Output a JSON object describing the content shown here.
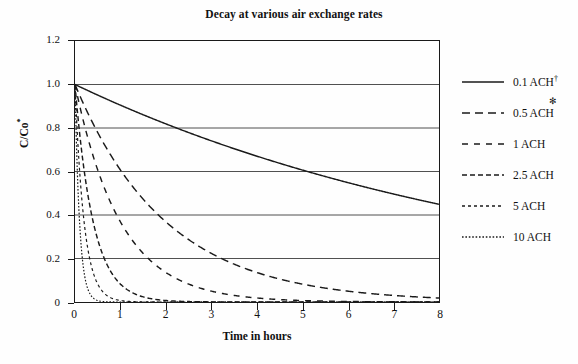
{
  "chart_data": {
    "type": "line",
    "title": "Decay at various air exchange rates",
    "xlabel": "Time in hours",
    "ylabel": "C/Co*",
    "ylabel_base": "C/Co",
    "ylabel_sup": "*",
    "xlim": [
      0,
      8
    ],
    "ylim": [
      0,
      1.2
    ],
    "x_ticks": [
      "0",
      "1",
      "2",
      "3",
      "4",
      "5",
      "6",
      "7",
      "8"
    ],
    "x_tick_values": [
      0,
      1,
      2,
      3,
      4,
      5,
      6,
      7,
      8
    ],
    "y_ticks": [
      "0",
      "0.2",
      "0.4",
      "0.6",
      "0.8",
      "1.0",
      "1.2"
    ],
    "y_tick_values": [
      0,
      0.2,
      0.4,
      0.6,
      0.8,
      1.0,
      1.2
    ],
    "grid": "horizontal",
    "grid_values": [
      0.2,
      0.4,
      0.6,
      0.8,
      1.0
    ],
    "legend_position": "right",
    "formula": "C/Co = exp(-k * t)",
    "x": [
      0,
      0.25,
      0.5,
      0.75,
      1,
      1.25,
      1.5,
      1.75,
      2,
      2.5,
      3,
      3.5,
      4,
      4.5,
      5,
      5.5,
      6,
      6.5,
      7,
      7.5,
      8
    ],
    "series": [
      {
        "name": "0.1 ACH",
        "rate": 0.1,
        "dash": "none",
        "values": [
          1.0,
          0.975,
          0.951,
          0.928,
          0.905,
          0.882,
          0.861,
          0.839,
          0.819,
          0.779,
          0.741,
          0.705,
          0.67,
          0.638,
          0.607,
          0.577,
          0.549,
          0.522,
          0.497,
          0.472,
          0.449
        ]
      },
      {
        "name": "0.5 ACH",
        "rate": 0.5,
        "dash": "8,5",
        "values": [
          1.0,
          0.882,
          0.779,
          0.687,
          0.607,
          0.535,
          0.472,
          0.417,
          0.368,
          0.287,
          0.223,
          0.174,
          0.135,
          0.105,
          0.082,
          0.064,
          0.05,
          0.039,
          0.03,
          0.024,
          0.018
        ]
      },
      {
        "name": "1 ACH",
        "rate": 1.0,
        "dash": "6,6",
        "values": [
          1.0,
          0.779,
          0.607,
          0.472,
          0.368,
          0.287,
          0.223,
          0.174,
          0.135,
          0.082,
          0.05,
          0.03,
          0.018,
          0.011,
          0.0067,
          0.0041,
          0.0025,
          0.0015,
          0.0009,
          0.0006,
          0.0003
        ]
      },
      {
        "name": "2.5 ACH",
        "rate": 2.5,
        "dash": "5,3",
        "values": [
          1.0,
          0.535,
          0.287,
          0.153,
          0.082,
          0.044,
          0.024,
          0.013,
          0.0067,
          0.0019,
          0.0006,
          0.0002,
          5e-05,
          1e-05,
          0.0,
          0.0,
          0.0,
          0.0,
          0.0,
          0.0,
          0.0
        ]
      },
      {
        "name": "5 ACH",
        "rate": 5.0,
        "dash": "3,3",
        "values": [
          1.0,
          0.287,
          0.082,
          0.024,
          0.0067,
          0.0019,
          0.0006,
          0.0002,
          5e-05,
          0.0,
          0.0,
          0.0,
          0.0,
          0.0,
          0.0,
          0.0,
          0.0,
          0.0,
          0.0,
          0.0,
          0.0
        ]
      },
      {
        "name": "10 ACH",
        "rate": 10.0,
        "dash": "1.6,1.8",
        "values": [
          1.0,
          0.082,
          0.0067,
          0.0006,
          5e-05,
          0.0,
          0.0,
          0.0,
          0.0,
          0.0,
          0.0,
          0.0,
          0.0,
          0.0,
          0.0,
          0.0,
          0.0,
          0.0,
          0.0,
          0.0,
          0.0
        ]
      }
    ]
  },
  "legend": {
    "entries": [
      {
        "label": "0.1 ACH",
        "sup": "†",
        "floatmark": "",
        "dash": "none"
      },
      {
        "label": "0.5 ACH",
        "sup": "",
        "floatmark": "✻",
        "dash": "8,5"
      },
      {
        "label": "1 ACH",
        "sup": "",
        "floatmark": "",
        "dash": "6,6"
      },
      {
        "label": "2.5 ACH",
        "sup": "",
        "floatmark": "",
        "dash": "5,3"
      },
      {
        "label": "5 ACH",
        "sup": "",
        "floatmark": "",
        "dash": "3,3"
      },
      {
        "label": "10 ACH",
        "sup": "",
        "floatmark": "",
        "dash": "1.6,1.8"
      }
    ]
  },
  "colors": {
    "line": "#1a1a1a",
    "grid": "#3a3a3a",
    "axis": "#1a1a1a",
    "background": "#fefefe",
    "text": "#111111"
  }
}
